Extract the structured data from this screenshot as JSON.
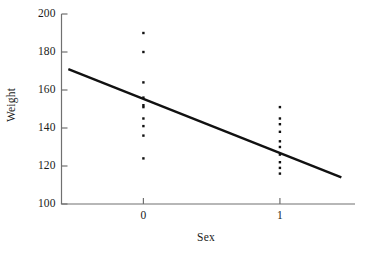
{
  "chart_data": {
    "type": "scatter",
    "title": "",
    "xlabel": "Sex",
    "ylabel": "Weight",
    "xlim": [
      -0.6,
      1.55
    ],
    "ylim": [
      100,
      200
    ],
    "x_ticks": [
      0,
      1
    ],
    "x_tick_labels": [
      "0",
      "1"
    ],
    "y_ticks": [
      100,
      120,
      140,
      160,
      180,
      200
    ],
    "y_tick_labels": [
      "100",
      "120",
      "140",
      "160",
      "180",
      "200"
    ],
    "grid": false,
    "legend": null,
    "marker": "square-dot",
    "marker_color": "#111111",
    "points": [
      {
        "x": 0,
        "y": 190
      },
      {
        "x": 0,
        "y": 180
      },
      {
        "x": 0,
        "y": 164
      },
      {
        "x": 0,
        "y": 156
      },
      {
        "x": 0,
        "y": 152
      },
      {
        "x": 0,
        "y": 151
      },
      {
        "x": 0,
        "y": 145
      },
      {
        "x": 0,
        "y": 141
      },
      {
        "x": 0,
        "y": 136
      },
      {
        "x": 0,
        "y": 124
      },
      {
        "x": 1,
        "y": 151
      },
      {
        "x": 1,
        "y": 145
      },
      {
        "x": 1,
        "y": 142
      },
      {
        "x": 1,
        "y": 138
      },
      {
        "x": 1,
        "y": 133
      },
      {
        "x": 1,
        "y": 130
      },
      {
        "x": 1,
        "y": 126
      },
      {
        "x": 1,
        "y": 122
      },
      {
        "x": 1,
        "y": 119
      },
      {
        "x": 1,
        "y": 116
      }
    ],
    "series": [
      {
        "name": "Sex = 0",
        "category": "0",
        "values": [
          190,
          180,
          164,
          156,
          152,
          151,
          145,
          141,
          136,
          124
        ]
      },
      {
        "name": "Sex = 1",
        "category": "1",
        "values": [
          151,
          145,
          142,
          138,
          133,
          130,
          126,
          122,
          119,
          116
        ]
      }
    ],
    "regression_line": {
      "label": "",
      "color": "#111111",
      "width": 2.4,
      "x_start": -0.55,
      "y_start": 171,
      "x_end": 1.45,
      "y_end": 114,
      "intercept": 152.2,
      "slope": -28.5
    },
    "axis_color": "#707070",
    "background": "#ffffff"
  }
}
